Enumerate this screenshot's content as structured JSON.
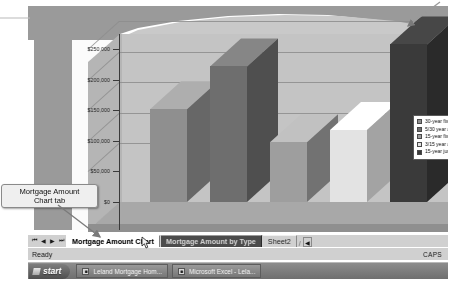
{
  "window": {
    "app": "Microsoft Excel",
    "status_left": "Ready",
    "status_right": "CAPS"
  },
  "annotations": [
    {
      "id": "tab-callout",
      "text": "Mortgage Amount\nChart tab",
      "line1": "Mortgage Amount",
      "line2": "Chart tab"
    }
  ],
  "sheet_tabs": {
    "nav": {
      "first": "⏮",
      "prev": "◀",
      "next": "▶",
      "last": "⏭"
    },
    "tabs": [
      {
        "label": "Mortgage Amount Chart",
        "state": "active"
      },
      {
        "label": "Mortgage Amount by Type",
        "state": "hot"
      },
      {
        "label": "Sheet2",
        "state": "idle"
      }
    ],
    "scroll_right": "◀"
  },
  "taskbar": {
    "start_label": "start",
    "start_icon": "windows-flag-icon",
    "items": [
      {
        "label": "Leland Mortgage Hom...",
        "icon": "word-document-icon"
      },
      {
        "label": "Microsoft Excel - Lela...",
        "icon": "excel-sheet-icon"
      }
    ]
  },
  "chart_data": {
    "type": "bar",
    "title": "",
    "xlabel": "",
    "ylabel": "",
    "grid": true,
    "legend_position": "right",
    "ylim": [
      0,
      275000
    ],
    "ytick_labels": [
      "$250,000",
      "$200,000",
      "$150,000",
      "$100,000",
      "$50,000",
      "$0"
    ],
    "ytick_values": [
      250000,
      200000,
      150000,
      100000,
      50000,
      0
    ],
    "categories": [
      "30-year fixed",
      "5/30 year adjustable",
      "15-year fixed",
      "3/15 year adjustable",
      "15-year jumbo"
    ],
    "values": [
      152000,
      222000,
      98000,
      118000,
      258000
    ],
    "series": [
      {
        "name": "Mortgage Amount",
        "values": [
          152000,
          222000,
          98000,
          118000,
          258000
        ]
      }
    ],
    "bar_colors": [
      "#8f8f8f",
      "#6e6e6e",
      "#9e9e9e",
      "#e3e3e3",
      "#3a3a3a"
    ],
    "legend": [
      {
        "label": "30-year fixed",
        "color": "#8f8f8f"
      },
      {
        "label": "5/30 year adjustab",
        "color": "#6e6e6e"
      },
      {
        "label": "15-year fixed",
        "color": "#9e9e9e"
      },
      {
        "label": "3/15 year adjustab",
        "color": "#e3e3e3"
      },
      {
        "label": "15-year jumbo",
        "color": "#3a3a3a"
      }
    ]
  }
}
